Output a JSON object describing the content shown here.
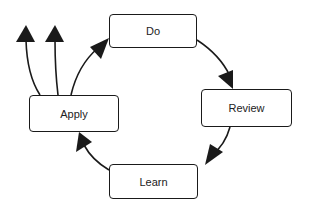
{
  "diagram": {
    "type": "cycle",
    "nodes": [
      {
        "id": "do",
        "label": "Do"
      },
      {
        "id": "review",
        "label": "Review"
      },
      {
        "id": "learn",
        "label": "Learn"
      },
      {
        "id": "apply",
        "label": "Apply"
      }
    ],
    "edges": [
      {
        "from": "apply",
        "to": "do"
      },
      {
        "from": "do",
        "to": "review"
      },
      {
        "from": "review",
        "to": "learn"
      },
      {
        "from": "learn",
        "to": "apply"
      },
      {
        "from": "apply",
        "to": "outside-1"
      },
      {
        "from": "apply",
        "to": "outside-2"
      }
    ],
    "colors": {
      "stroke": "#1a1a1a",
      "fill": "#ffffff"
    }
  }
}
